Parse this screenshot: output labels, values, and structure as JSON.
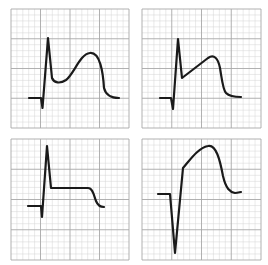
{
  "figure": {
    "grid": {
      "major_color": "#a8a8a8",
      "minor_color": "#d4d4d4",
      "major_divisions": 4,
      "minor_per_major": 5
    },
    "trace_color": "#1a1a1a",
    "panels": [
      {
        "id": "top-left",
        "x": 11,
        "y": 9,
        "w": 118,
        "h": 119,
        "shape": "tall R spike followed by concave dip then large rounded dome (hyperacute / tombstone-like ST elevation)",
        "path": "M29,98 L41,98 L42.5,108 L48,38 L52,78 C54,83 60,84 66,80 C74,74 80,54 90,53 C100,52 103,72 104,88 C106,96 112,98 119,98"
      },
      {
        "id": "top-right",
        "x": 142,
        "y": 9,
        "w": 119,
        "h": 119,
        "shape": "tall R spike then straight upsloping ST segment to rounded peak then drop",
        "path": "M160,98 L171,98 L173,109 L178,39 L182,78 L208,58 C214,54 218,58 220,68 C222,80 223,90 226,93 C230,97 236,97 241,97"
      },
      {
        "id": "bottom-left",
        "x": 11,
        "y": 139,
        "w": 118,
        "h": 121,
        "shape": "tall R spike then flat horizontal elevated ST plateau then step down",
        "path": "M28,206 L41,206 L42,217 L47,146 L51,188 L88,188 C93,188 94,196 96,201 C98,206 101,207 104,207"
      },
      {
        "id": "bottom-right",
        "x": 142,
        "y": 139,
        "w": 119,
        "h": 121,
        "shape": "deep QS complex then convex ST elevation dome",
        "path": "M158,194 L170,194 L175,253 L183,168 C190,160 198,148 208,146 C216,144 220,160 223,176 C226,189 230,192 235,193 C238,193 240,192 241,192"
      }
    ]
  }
}
